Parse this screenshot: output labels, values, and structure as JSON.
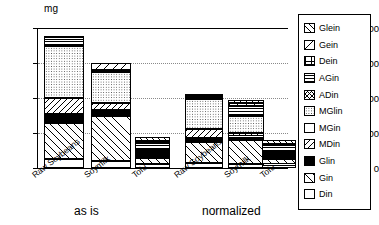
{
  "chart_data": {
    "type": "bar",
    "title": "",
    "subtitle": "",
    "xlabel": "",
    "ylabel": "mg",
    "ylim": [
      0,
      400
    ],
    "yticks": [
      0,
      100,
      200,
      300,
      400
    ],
    "grid": "horizontal dotted gridlines at 100, 200, 300",
    "legend_position": "right, boxed, outside plot area",
    "stacked": true,
    "categories": [
      "Raw Soybeans",
      "Soymilk",
      "Tofu",
      "Raw Soybeans",
      "Soymilk",
      "Tofu"
    ],
    "groups": [
      {
        "label": "as is",
        "categories": [
          "Raw Soybeans",
          "Soymilk",
          "Tofu"
        ]
      },
      {
        "label": "normalized",
        "categories": [
          "Raw Soybeans",
          "Soymilk",
          "Tofu"
        ]
      }
    ],
    "series": [
      {
        "name": "Din",
        "values": [
          25,
          20,
          12,
          14,
          11,
          10
        ]
      },
      {
        "name": "Gin",
        "values": [
          105,
          128,
          18,
          59,
          70,
          17
        ]
      },
      {
        "name": "Glin",
        "values": [
          25,
          17,
          10,
          14,
          9,
          9
        ]
      },
      {
        "name": "MDin",
        "values": [
          45,
          20,
          6,
          25,
          11,
          5
        ]
      },
      {
        "name": "MGin",
        "values": [
          0,
          0,
          0,
          0,
          0,
          0
        ]
      },
      {
        "name": "MGlin",
        "values": [
          150,
          88,
          6,
          84,
          48,
          6
        ]
      },
      {
        "name": "ADin",
        "values": [
          0,
          0,
          0,
          0,
          0,
          0
        ]
      },
      {
        "name": "AGin",
        "values": [
          20,
          8,
          20,
          11,
          28,
          18
        ]
      },
      {
        "name": "Dein",
        "values": [
          0,
          0,
          6,
          0,
          0,
          5
        ]
      },
      {
        "name": "Gein",
        "values": [
          0,
          19,
          0,
          0,
          10,
          0
        ]
      },
      {
        "name": "Glein",
        "values": [
          8,
          0,
          10,
          4,
          8,
          10
        ]
      }
    ],
    "totals": [
      378,
      300,
      88,
      211,
      195,
      80
    ]
  },
  "axis": {
    "unit": "mg",
    "ticks": [
      "400",
      "300",
      "200",
      "100",
      "0"
    ]
  },
  "legend": {
    "items": [
      {
        "label": "Glein",
        "pattern": "diagonal-hatch-up"
      },
      {
        "label": "Gein",
        "pattern": "diagonal-line-down-sparse"
      },
      {
        "label": "Dein",
        "pattern": "grid-crosshatch"
      },
      {
        "label": "AGin",
        "pattern": "horizontal-lines"
      },
      {
        "label": "ADin",
        "pattern": "fine-crosshatch-diagonal"
      },
      {
        "label": "MGlin",
        "pattern": "dotted-stipple"
      },
      {
        "label": "MGin",
        "pattern": "solid-white"
      },
      {
        "label": "MDin",
        "pattern": "diagonal-hatch-down"
      },
      {
        "label": "Glin",
        "pattern": "solid-black"
      },
      {
        "label": "Gin",
        "pattern": "diagonal-hatch-up-wide"
      },
      {
        "label": "Din",
        "pattern": "solid-white"
      }
    ]
  },
  "groups": {
    "as_is": "as is",
    "normalized": "normalized"
  },
  "categories": {
    "c0": "Raw Soybeans",
    "c1": "Soymilk",
    "c2": "Tofu",
    "c3": "Raw Soybeans",
    "c4": "Soymilk",
    "c5": "Tofu"
  }
}
